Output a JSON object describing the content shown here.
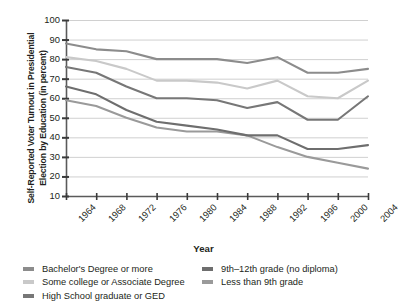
{
  "chart_data": {
    "type": "line",
    "title": "",
    "xlabel": "Year",
    "ylabel": "Self-Reported Voter Turnout in Presidential Election by Education (in percent)",
    "x": [
      1964,
      1968,
      1972,
      1976,
      1980,
      1984,
      1988,
      1992,
      1996,
      2000,
      2004
    ],
    "xtick_labels": [
      "1964",
      "1968",
      "1972",
      "1976",
      "1980",
      "1984",
      "1988",
      "1992",
      "1996",
      "2000",
      "2004"
    ],
    "ytick_labels": [
      "100",
      "90",
      "80",
      "70",
      "60",
      "50",
      "40",
      "30",
      "20",
      "10"
    ],
    "yticks": [
      100,
      90,
      80,
      70,
      60,
      50,
      40,
      30,
      20,
      10
    ],
    "ylim": [
      10,
      100
    ],
    "grid": true,
    "legend_position": "bottom",
    "series": [
      {
        "name": "Bachelor's Degree or more",
        "color": "#8c8c8c",
        "values": [
          88,
          85,
          84,
          80,
          80,
          80,
          78,
          81,
          73,
          73,
          75
        ]
      },
      {
        "name": "Some college or Associate Degree",
        "color": "#c9c9c9",
        "values": [
          81,
          79,
          75,
          69,
          69,
          68,
          65,
          69,
          61,
          60,
          69
        ]
      },
      {
        "name": "High School graduate or GED",
        "color": "#777777",
        "values": [
          76,
          73,
          66,
          60,
          60,
          59,
          55,
          58,
          49,
          49,
          61
        ]
      },
      {
        "name": "9th–12th grade (no diploma)",
        "color": "#6e6e6e",
        "values": [
          66,
          62,
          54,
          48,
          46,
          44,
          41,
          41,
          34,
          34,
          36
        ]
      },
      {
        "name": "Less than 9th grade",
        "color": "#9a9a9a",
        "values": [
          59,
          56,
          50,
          45,
          43,
          43,
          41,
          35,
          30,
          27,
          24
        ]
      }
    ]
  },
  "axis": {
    "x_title": "Year",
    "y_title_line1": "Self-Reported Voter Turnout in Presidential",
    "y_title_line2": "Election by Education (in percent)"
  },
  "legend": {
    "left_items": [
      {
        "label": "Bachelor's Degree or more",
        "color": "#8c8c8c"
      },
      {
        "label": "Some college or Associate Degree",
        "color": "#c9c9c9"
      },
      {
        "label": "High School graduate or GED",
        "color": "#777777"
      }
    ],
    "right_items": [
      {
        "label": "9th–12th grade (no diploma)",
        "color": "#6e6e6e"
      },
      {
        "label": "Less than 9th grade",
        "color": "#9a9a9a"
      }
    ]
  },
  "colors": {
    "axis": "#5a5a5a",
    "grid": "#c4c4c4",
    "text": "#231f20"
  }
}
